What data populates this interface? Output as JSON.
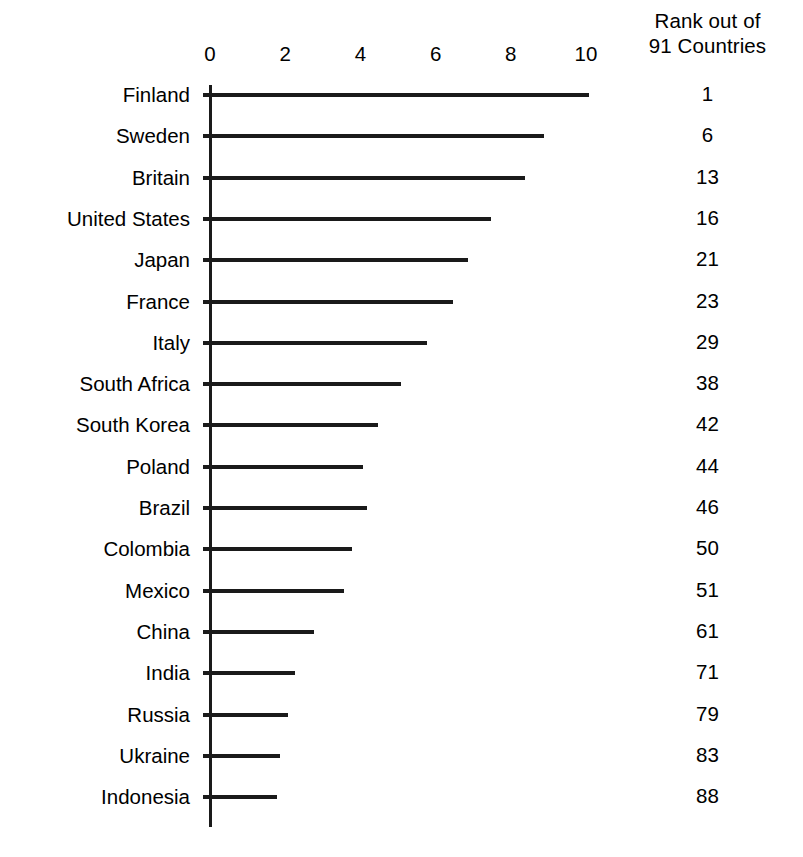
{
  "chart_data": {
    "type": "bar",
    "orientation": "horizontal",
    "title": "",
    "subtitle": "",
    "xlabel": "",
    "ylabel": "",
    "xlim": [
      0,
      10
    ],
    "xticks": [
      0,
      2,
      4,
      6,
      8,
      10
    ],
    "xtick_labels": [
      "0",
      "2",
      "4",
      "6",
      "8",
      "10"
    ],
    "grid": false,
    "legend": null,
    "annotations": [],
    "rank_column_header_line1": "Rank out of",
    "rank_column_header_line2": "91 Countries",
    "categories": [
      "Finland",
      "Sweden",
      "Britain",
      "United States",
      "Japan",
      "France",
      "Italy",
      "South Africa",
      "South Korea",
      "Poland",
      "Brazil",
      "Colombia",
      "Mexico",
      "China",
      "India",
      "Russia",
      "Ukraine",
      "Indonesia"
    ],
    "values": [
      10.1,
      8.9,
      8.4,
      7.5,
      6.9,
      6.5,
      5.8,
      5.1,
      4.5,
      4.1,
      4.2,
      3.8,
      3.6,
      2.8,
      2.3,
      2.1,
      1.9,
      1.8
    ],
    "ranks": [
      1,
      6,
      13,
      16,
      21,
      23,
      29,
      38,
      42,
      44,
      46,
      50,
      51,
      61,
      71,
      79,
      83,
      88
    ],
    "colors": {
      "bar": "#1a1a1a",
      "axis": "#1a1a1a",
      "background": "#ffffff",
      "text": "#000000"
    }
  }
}
